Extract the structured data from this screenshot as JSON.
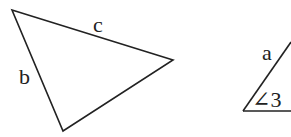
{
  "diagram": {
    "triangle": {
      "vertices": [
        [
          12,
          10
        ],
        [
          173,
          60
        ],
        [
          63,
          131
        ]
      ],
      "side_labels": {
        "c": "c",
        "b": "b"
      }
    },
    "partial_triangle": {
      "labels": {
        "a": "a",
        "angle": "∠3"
      }
    },
    "colors": {
      "stroke": "#222222",
      "background": "#ffffff"
    }
  }
}
